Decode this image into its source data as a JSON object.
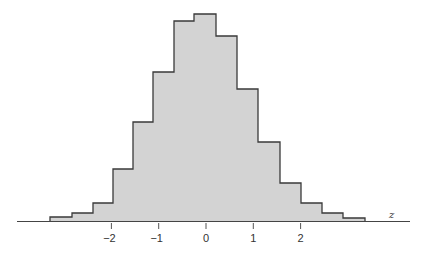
{
  "chart_data": {
    "type": "bar",
    "subtype": "histogram",
    "title": "",
    "xlabel": "z",
    "ylabel": "",
    "xlim": [
      -3.8,
      4.3
    ],
    "grid": false,
    "legend": null,
    "x_ticks": [
      -2,
      -1,
      0,
      1,
      2
    ],
    "x_tick_labels": [
      "−2",
      "−1",
      "0",
      "1",
      "2"
    ],
    "bin_width": 0.45,
    "bin_edges": [
      -3.3,
      -2.85,
      -2.4,
      -1.95,
      -1.5,
      -1.05,
      -0.6,
      -0.15,
      0.3,
      0.75,
      1.2,
      1.65,
      2.1,
      2.55,
      3.0,
      3.45
    ],
    "categories": [
      "-3.3–-2.85",
      "-2.85–-2.4",
      "-2.4–-1.95",
      "-1.95–-1.5",
      "-1.5–-1.05",
      "-1.05–-0.6",
      "-0.6–-0.15",
      "-0.15–0.3",
      "0.3–0.75",
      "0.75–1.2",
      "1.2–1.65",
      "1.65–2.1",
      "2.1–2.55",
      "2.55–3.0",
      "3.0–3.45"
    ],
    "values": [
      4,
      8,
      18,
      52,
      99,
      149,
      200,
      207,
      185,
      132,
      79,
      38,
      18,
      8,
      3
    ],
    "values_note": "relative bar heights (no y-axis shown)",
    "fill_color": "#d3d3d3",
    "edge_color": "#3a3a3a"
  },
  "layout": {
    "baseline_y": 221,
    "axis_x_start": 17,
    "axis_x_end": 410,
    "zero_x": 206,
    "px_per_unit": 47.3,
    "bar_pixel_edges": [
      50,
      72,
      93,
      113,
      133,
      153,
      174,
      194,
      216,
      237,
      258,
      280,
      301,
      322,
      343,
      365
    ]
  }
}
